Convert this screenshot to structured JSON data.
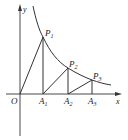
{
  "figure": {
    "axes": {
      "x_label": "x",
      "y_label": "y",
      "origin_label": "O"
    },
    "curve": "decreasing hyperbola-like curve in first quadrant",
    "points": [
      {
        "name": "P",
        "sub": "1"
      },
      {
        "name": "P",
        "sub": "2"
      },
      {
        "name": "P",
        "sub": "3"
      }
    ],
    "feet": [
      {
        "name": "A",
        "sub": "1"
      },
      {
        "name": "A",
        "sub": "2"
      },
      {
        "name": "A",
        "sub": "3"
      }
    ],
    "colors": {
      "stroke": "#333333",
      "text": "#222222"
    }
  }
}
